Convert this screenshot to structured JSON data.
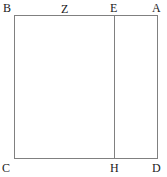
{
  "figure": {
    "type": "geometry-diagram",
    "background_color": "#ffffff",
    "stroke_color": "#808080",
    "label_color": "#1a1a1a",
    "rectangle": {
      "corners": {
        "top_left": "B",
        "top_right": "A",
        "bottom_left": "C",
        "bottom_right": "D"
      }
    },
    "divider": {
      "top_endpoint": "E",
      "bottom_endpoint": "H"
    },
    "edge_points": [
      {
        "label": "Z",
        "edge": "top"
      }
    ],
    "labels": [
      {
        "id": "B",
        "text": "B"
      },
      {
        "id": "Z",
        "text": "Z"
      },
      {
        "id": "E",
        "text": "E"
      },
      {
        "id": "A",
        "text": "A"
      },
      {
        "id": "C",
        "text": "C"
      },
      {
        "id": "H",
        "text": "H"
      },
      {
        "id": "D",
        "text": "D"
      }
    ]
  }
}
